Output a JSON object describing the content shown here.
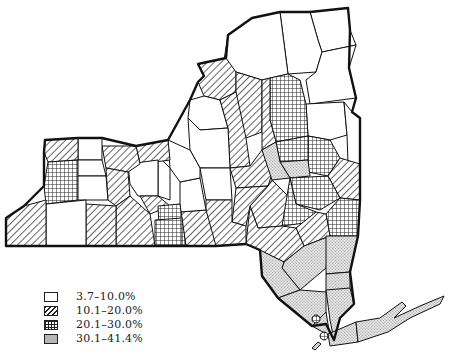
{
  "map": {
    "subject": "New York State counties (choropleth)",
    "legend": {
      "items": [
        {
          "label": "3.7–10.0%",
          "pattern": "blank"
        },
        {
          "label": "10.1–20.0%",
          "pattern": "diagonal-hatch"
        },
        {
          "label": "20.1–30.0%",
          "pattern": "crosshatch-grid"
        },
        {
          "label": "30.1–41.4%",
          "pattern": "stipple"
        }
      ]
    },
    "colors": {
      "ink": "#111111",
      "background": "#ffffff",
      "stipple": "#cfcfcf"
    }
  }
}
